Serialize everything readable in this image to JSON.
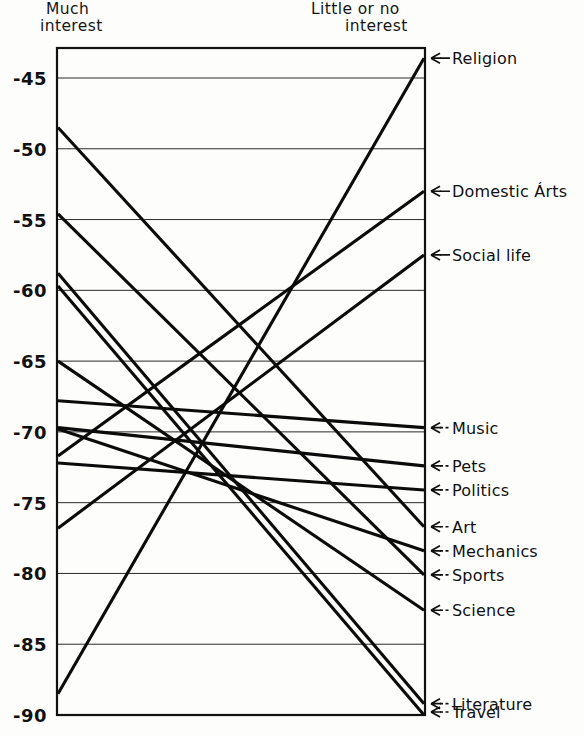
{
  "header": {
    "left_title_line1": "Much",
    "left_title_line2": "interest",
    "right_title_line1": "Little or no",
    "right_title_line2": "interest"
  },
  "axis": {
    "tick_labels": [
      "-45",
      "-50",
      "-55",
      "-60",
      "-65",
      "-70",
      "-75",
      "-80",
      "-85",
      "-90"
    ],
    "tick_values": [
      -45,
      -50,
      -55,
      -60,
      -65,
      -70,
      -75,
      -80,
      -85,
      -90
    ]
  },
  "right_labels": [
    "Religion",
    "Domestic Árts",
    "Social life",
    "Music",
    "Pets",
    "Politics",
    "Art",
    "Mechanics",
    "Sports",
    "Science",
    "Literature",
    "Travel"
  ],
  "chart_data": {
    "type": "line",
    "title": "",
    "subtitle": "",
    "xlabel": "",
    "ylabel": "",
    "x": [
      "Much interest",
      "Little or no interest"
    ],
    "xlabel_left": "Much interest",
    "xlabel_right": "Little or no interest",
    "ylim": [
      -90,
      -43
    ],
    "y_ticks": [
      -45,
      -50,
      -55,
      -60,
      -65,
      -70,
      -75,
      -80,
      -85,
      -90
    ],
    "grid": true,
    "legend": "right-endpoint-labels",
    "note": "Parallel-coordinates / slope chart: each line connects a score at 'Much interest' (left axis) to a score at 'Little or no interest' (right axis).",
    "series": [
      {
        "name": "Religion",
        "left": -88.5,
        "right": -43.6
      },
      {
        "name": "Domestic Árts",
        "left": -71.7,
        "right": -53.0
      },
      {
        "name": "Social life",
        "left": -76.8,
        "right": -57.5
      },
      {
        "name": "Music",
        "left": -67.8,
        "right": -69.7
      },
      {
        "name": "Pets",
        "left": -69.7,
        "right": -72.4
      },
      {
        "name": "Politics",
        "left": -72.2,
        "right": -74.1
      },
      {
        "name": "Art",
        "left": -48.5,
        "right": -76.7
      },
      {
        "name": "Mechanics",
        "left": -69.8,
        "right": -78.4
      },
      {
        "name": "Sports",
        "left": -54.6,
        "right": -80.1
      },
      {
        "name": "Science",
        "left": -65.0,
        "right": -82.6
      },
      {
        "name": "Literature",
        "left": -58.8,
        "right": -89.2
      },
      {
        "name": "Travel",
        "left": -59.7,
        "right": -90.5
      }
    ]
  }
}
